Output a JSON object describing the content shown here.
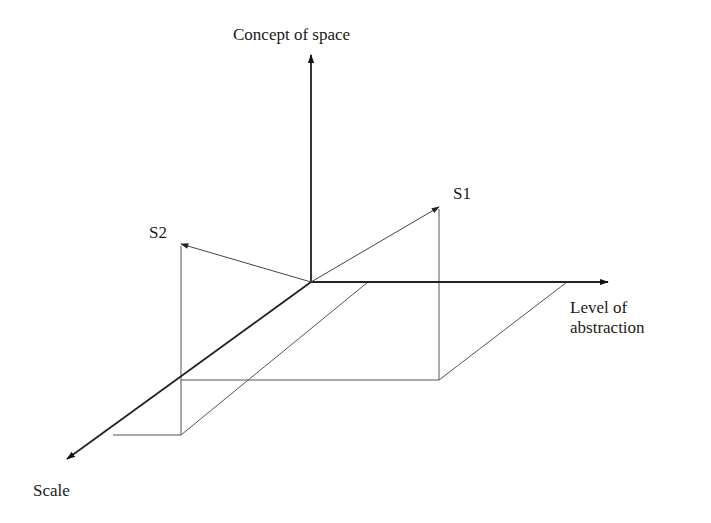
{
  "diagram": {
    "type": "3d-axes-vector-diagram",
    "axes": {
      "vertical": {
        "label": "Concept of space"
      },
      "horizontal": {
        "label_line1": "Level of",
        "label_line2": "abstraction"
      },
      "depth": {
        "label": "Scale"
      }
    },
    "vectors": [
      {
        "id": "S1",
        "label": "S1"
      },
      {
        "id": "S2",
        "label": "S2"
      }
    ],
    "colors": {
      "axis": "#222222",
      "projection_lines": "#555555",
      "text": "#1a1a1a",
      "background": "#ffffff"
    }
  }
}
